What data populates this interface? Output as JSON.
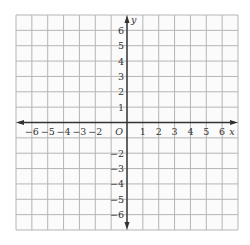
{
  "chart_data": {
    "type": "coordinate-grid",
    "title": "",
    "xlabel": "x",
    "ylabel": "y",
    "origin_label": "O",
    "xlim": [
      -7,
      7
    ],
    "ylim": [
      -7,
      7
    ],
    "grid": true,
    "x_tick_labels": [
      "−6",
      "−5",
      "−4",
      "−3",
      "−2",
      "1",
      "2",
      "3",
      "4",
      "5",
      "6"
    ],
    "x_tick_values": [
      -6,
      -5,
      -4,
      -3,
      -2,
      1,
      2,
      3,
      4,
      5,
      6
    ],
    "y_tick_labels": [
      "6",
      "5",
      "4",
      "3",
      "2",
      "1",
      "−2",
      "−3",
      "−4",
      "−5",
      "−6"
    ],
    "y_tick_values": [
      6,
      5,
      4,
      3,
      2,
      1,
      -2,
      -3,
      -4,
      -5,
      -6
    ],
    "colors": {
      "grid": "#b5b5b5",
      "axis": "#333333",
      "text": "#333333"
    }
  }
}
